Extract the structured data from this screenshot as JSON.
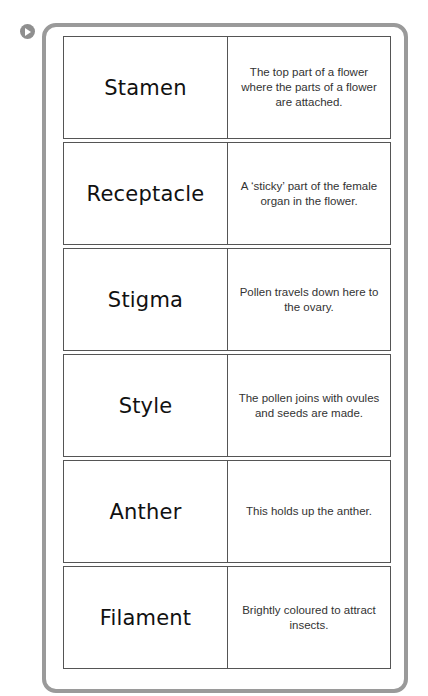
{
  "icons": {
    "marker": "play-circle-icon"
  },
  "colors": {
    "frame": "#9a9a9a",
    "border": "#555555",
    "text": "#111111"
  },
  "rows": [
    {
      "term": "Stamen",
      "definition": "The top part of a flower where the parts of a flower are attached."
    },
    {
      "term": "Receptacle",
      "definition": "A ‘sticky’ part of the female organ in the flower."
    },
    {
      "term": "Stigma",
      "definition": "Pollen travels down here to the ovary."
    },
    {
      "term": "Style",
      "definition": "The pollen joins with ovules and seeds are made."
    },
    {
      "term": "Anther",
      "definition": "This holds up the anther."
    },
    {
      "term": "Filament",
      "definition": "Brightly coloured to attract insects."
    }
  ]
}
